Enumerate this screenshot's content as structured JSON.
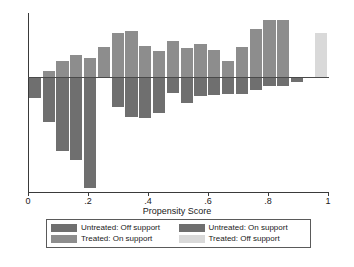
{
  "chart_data": {
    "type": "bar",
    "title": "",
    "subtitle": "",
    "xlabel": "Propensity Score",
    "ylabel": "",
    "xlim": [
      0,
      1
    ],
    "ylim": [
      -1.0,
      0.62
    ],
    "grid": false,
    "legend_position": "below-axis",
    "xticks": [
      0,
      0.2,
      0.4,
      0.6,
      0.8,
      1
    ],
    "xticklabels": [
      "0",
      ".2",
      ".4",
      ".6",
      ".8",
      "1"
    ],
    "bin_width": 0.046,
    "x": [
      0.023,
      0.069,
      0.115,
      0.161,
      0.207,
      0.253,
      0.299,
      0.345,
      0.391,
      0.437,
      0.483,
      0.529,
      0.575,
      0.621,
      0.667,
      0.713,
      0.759,
      0.805,
      0.851,
      0.897,
      0.977
    ],
    "series": [
      {
        "name": "Treated: On support",
        "color": "#8d8d8d",
        "direction": "up",
        "values": [
          0.0,
          0.055,
          0.155,
          0.215,
          0.185,
          0.295,
          0.425,
          0.445,
          0.3,
          0.255,
          0.35,
          0.285,
          0.315,
          0.265,
          0.155,
          0.29,
          0.465,
          0.555,
          0.555,
          0.0,
          0.0
        ]
      },
      {
        "name": "Treated: Off support",
        "color": "#d9d9d9",
        "direction": "up",
        "values": [
          0.0,
          0.0,
          0.0,
          0.0,
          0.0,
          0.0,
          0.0,
          0.0,
          0.0,
          0.0,
          0.0,
          0.0,
          0.0,
          0.0,
          0.0,
          0.0,
          0.0,
          0.0,
          0.0,
          0.0,
          0.43
        ]
      },
      {
        "name": "Untreated: On support",
        "color": "#6f6f6f",
        "direction": "down",
        "values": [
          0.0,
          0.0,
          0.0,
          0.0,
          0.0,
          0.0,
          0.265,
          0.35,
          0.36,
          0.31,
          0.135,
          0.225,
          0.165,
          0.155,
          0.145,
          0.15,
          0.11,
          0.08,
          0.075,
          0.04,
          0.0
        ]
      },
      {
        "name": "Untreated: Off support",
        "color": "#6f6f6f",
        "direction": "down",
        "values": [
          0.18,
          0.39,
          0.64,
          0.72,
          0.965,
          0.0,
          0.0,
          0.0,
          0.0,
          0.0,
          0.0,
          0.0,
          0.0,
          0.0,
          0.0,
          0.0,
          0.0,
          0.0,
          0.0,
          0.0,
          0.0
        ]
      }
    ]
  },
  "axis": {
    "x_title": "Propensity Score",
    "tick_labels": [
      "0",
      ".2",
      ".4",
      ".6",
      ".8",
      "1"
    ]
  },
  "legend": {
    "items": [
      {
        "label": "Untreated: Off support",
        "color": "#6f6f6f"
      },
      {
        "label": "Untreated: On support",
        "color": "#6f6f6f"
      },
      {
        "label": "Treated: On support",
        "color": "#8d8d8d"
      },
      {
        "label": "Treated: Off support",
        "color": "#d9d9d9"
      }
    ]
  },
  "colors": {
    "untreated_off_support": "#6f6f6f",
    "untreated_on_support": "#6f6f6f",
    "treated_on_support": "#8d8d8d",
    "treated_off_support": "#d9d9d9",
    "axis": "#3a3a3a",
    "background": "#ffffff"
  }
}
